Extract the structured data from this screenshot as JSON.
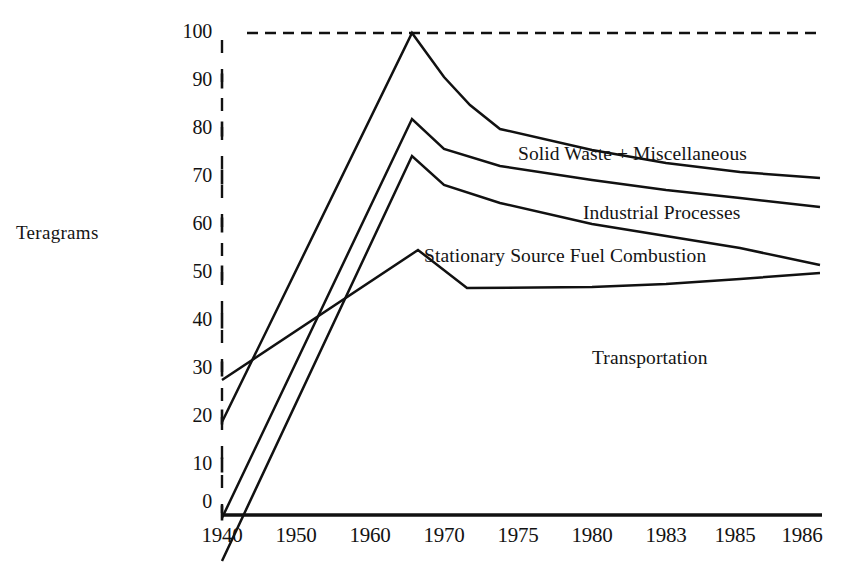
{
  "chart_data": {
    "type": "line",
    "title": "",
    "xlabel": "",
    "ylabel": "Teragrams",
    "x": [
      "1940",
      "1950",
      "1960",
      "1970",
      "1975",
      "1980",
      "1983",
      "1985",
      "1986"
    ],
    "x_positions_px": [
      222,
      295,
      370,
      444,
      518,
      592,
      666,
      740,
      806
    ],
    "ylim": [
      0,
      100
    ],
    "y_ticks": [
      0,
      10,
      20,
      30,
      40,
      50,
      60,
      70,
      80,
      90,
      100
    ],
    "y_tick_labels": [
      "0",
      "10",
      "20",
      "30",
      "40",
      "50",
      "60",
      "70",
      "80",
      "90",
      "100"
    ],
    "y_minor_ticks": [
      5,
      15,
      25,
      35,
      45,
      55,
      65,
      75,
      85,
      95
    ],
    "grid": false,
    "legend_position": "inline-right",
    "reference_line": {
      "value": 100,
      "style": "dashed",
      "label": "100"
    },
    "stacked": true,
    "series": [
      {
        "name": "Solid Waste + Miscellaneous",
        "label_position": "inline",
        "values": [
          81,
          88,
          95,
          98,
          82,
          78,
          75,
          72,
          70
        ],
        "peak_value": 100,
        "peak_x": "1968"
      },
      {
        "name": "Industrial Processes",
        "label_position": "inline",
        "values": [
          58,
          65,
          71,
          75,
          70,
          67,
          65,
          63,
          64
        ],
        "peak_value": 83,
        "peak_x": "1968"
      },
      {
        "name": "Stationary Source Fuel Combustion",
        "label_position": "inline",
        "values": [
          50,
          58,
          65,
          68,
          64,
          61,
          59,
          57,
          60
        ],
        "peak_value": 76,
        "peak_x": "1968"
      },
      {
        "name": "Transportation",
        "label_position": "inline",
        "values": [
          30,
          37,
          45,
          52,
          50,
          51,
          52,
          52,
          53
        ],
        "peak_value": 57,
        "peak_x": "1968"
      }
    ]
  },
  "axis": {
    "y_title": "Teragrams",
    "y_labels": [
      "100",
      "90",
      "80",
      "70",
      "60",
      "50",
      "40",
      "30",
      "20",
      "10",
      "0"
    ],
    "x_labels": [
      "1940",
      "1950",
      "1960",
      "1970",
      "1975",
      "1980",
      "1983",
      "1985",
      "1986"
    ]
  },
  "series_labels": {
    "solid_waste": "Solid Waste + Miscellaneous",
    "industrial": "Industrial Processes",
    "stationary": "Stationary Source Fuel Combustion",
    "transportation": "Transportation"
  }
}
